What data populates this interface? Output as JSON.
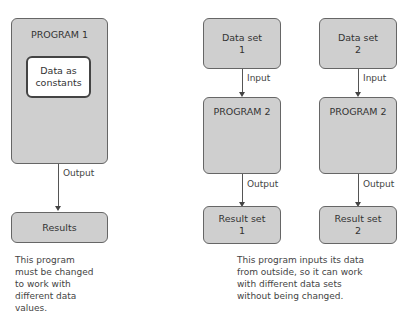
{
  "left": {
    "program_title": "PROGRAM 1",
    "inner_box": "Data as constants",
    "arrow_label": "Output",
    "result_box": "Results",
    "note": "This program must be changed to work with different data values."
  },
  "right": {
    "columns": [
      {
        "data_set_line1": "Data set",
        "data_set_line2": "1",
        "input_label": "Input",
        "program_title": "PROGRAM 2",
        "output_label": "Output",
        "result_line1": "Result set",
        "result_line2": "1"
      },
      {
        "data_set_line1": "Data set",
        "data_set_line2": "2",
        "input_label": "Input",
        "program_title": "PROGRAM 2",
        "output_label": "Output",
        "result_line1": "Result set",
        "result_line2": "2"
      }
    ],
    "note": "This program inputs its data from outside, so it can work with different data sets without being changed."
  },
  "colors": {
    "box_fill": "#cfcfcf",
    "box_border": "#666666",
    "inner_fill": "#ffffff"
  }
}
